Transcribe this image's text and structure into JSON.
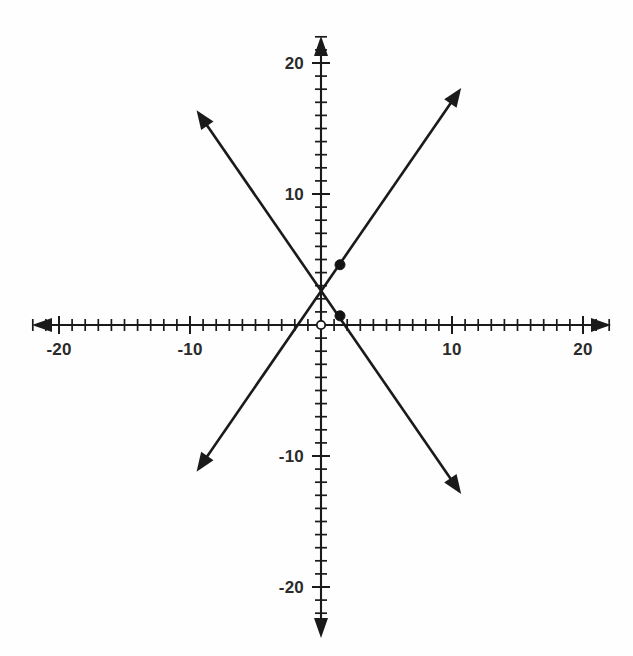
{
  "figure": {
    "background_color": "#fefefe",
    "ink_color": "#1a1a1a",
    "width": 633,
    "height": 656
  },
  "axes": {
    "x_axis_name": "x-axis",
    "y_axis_name": "y-axis",
    "x_labels": [
      "-20",
      "-10",
      "10",
      "20"
    ],
    "x_label_values": [
      -20,
      -10,
      10,
      20
    ],
    "y_labels": [
      "20",
      "10",
      "-10",
      "-20"
    ],
    "y_label_values": [
      20,
      10,
      -10,
      -20
    ],
    "tick_interval": 1,
    "label_interval": 10,
    "x_range": [
      -22,
      22
    ],
    "y_range": [
      -22,
      22
    ],
    "origin_px": [
      321,
      325
    ],
    "px_per_unit": 13.1,
    "arrows": [
      "left",
      "right",
      "up",
      "down"
    ]
  },
  "chart_data": {
    "type": "line",
    "xlabel": "x",
    "ylabel": "y",
    "xlim": [
      -22,
      22
    ],
    "ylim": [
      -22,
      22
    ],
    "grid": false,
    "legend": "none",
    "xticks": [
      -20,
      -10,
      0,
      10,
      20
    ],
    "yticks": [
      -20,
      -10,
      0,
      10,
      20
    ],
    "xtick_labels": [
      "-20",
      "-10",
      "",
      "10",
      "20"
    ],
    "ytick_labels": [
      "-20",
      "-10",
      "",
      "10",
      "20"
    ],
    "series": [
      {
        "name": "rising-line",
        "slope": 1.45,
        "intercept": 2.6,
        "equation": "y = 1.45x + 2.6",
        "x": [
          -9.5,
          10.7
        ],
        "y": [
          -11.2,
          18.1
        ],
        "arrow_start": true,
        "arrow_end": true
      },
      {
        "name": "falling-line",
        "slope": -1.45,
        "intercept": 2.6,
        "equation": "y = -1.45x + 2.6",
        "x": [
          -9.5,
          10.7
        ],
        "y": [
          16.4,
          -12.9
        ],
        "arrow_start": true,
        "arrow_end": true
      }
    ],
    "points": [
      {
        "name": "closed-point-upper",
        "x": 1.45,
        "y": 4.6,
        "style": "closed"
      },
      {
        "name": "closed-point-lower",
        "x": 1.45,
        "y": 0.7,
        "style": "closed"
      },
      {
        "name": "open-point-origin",
        "x": 0.0,
        "y": 0.0,
        "style": "open"
      }
    ],
    "intersection": {
      "x": 0.0,
      "y": 2.6
    }
  }
}
